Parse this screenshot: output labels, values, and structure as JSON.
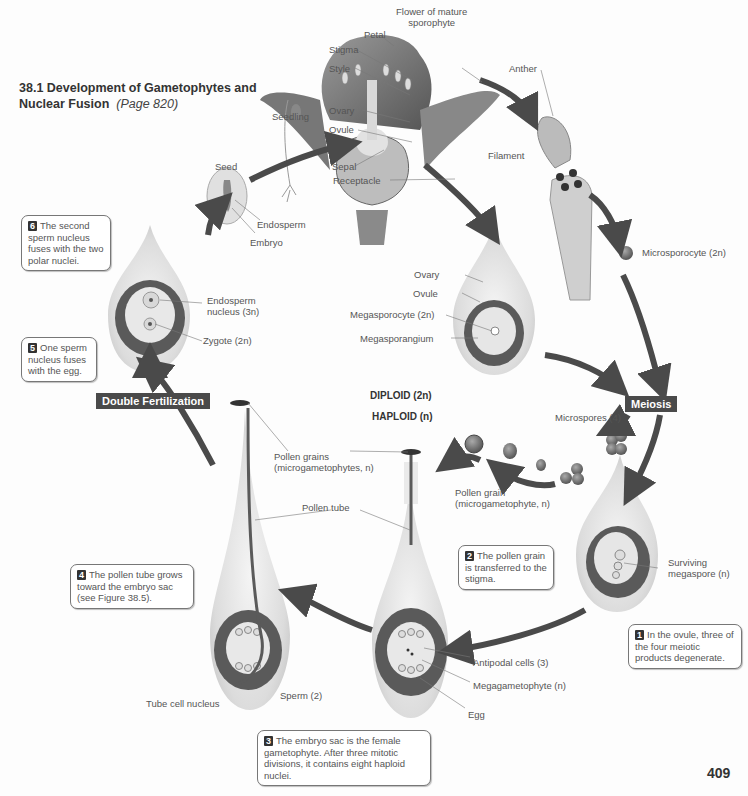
{
  "header": {
    "title": "38.1  Development of Gametophytes and Nuclear Fusion",
    "title_line1": "38.1  Development of Gametophytes and",
    "title_line2": "Nuclear Fusion",
    "page_ref": "(Page 820)"
  },
  "page_number": "409",
  "ploidy_legend": {
    "diploid": "DIPLOID (2n)",
    "haploid": "HAPLOID (n)"
  },
  "process_tags": {
    "meiosis": "Meiosis",
    "double_fertilization": "Double Fertilization"
  },
  "flower": {
    "caption_line1": "Flower of mature",
    "caption_line2": "sporophyte",
    "labels": {
      "petal": "Petal",
      "stigma": "Stigma",
      "style": "Style",
      "ovary": "Ovary",
      "ovule": "Ovule",
      "sepal": "Sepal",
      "receptacle": "Receptacle",
      "anther": "Anther",
      "filament": "Filament"
    }
  },
  "seed": {
    "seedling": "Seedling",
    "seed": "Seed",
    "endosperm": "Endosperm",
    "embryo": "Embryo"
  },
  "microspore_path": {
    "microsporocyte": "Microsporocyte (2n)",
    "microspores": "Microspores (4)",
    "pollen_grain_line1": "Pollen grain",
    "pollen_grain_line2": "(microgametophyte, n)"
  },
  "ovule_stage": {
    "ovary": "Ovary",
    "ovule": "Ovule",
    "megasporocyte": "Megasporocyte (2n)",
    "megasporangium": "Megasporangium",
    "surviving_line1": "Surviving",
    "surviving_line2": "megaspore (n)"
  },
  "gametophyte_stage": {
    "antipodal": "Antipodal cells (3)",
    "megagametophyte": "Megagametophyte (n)",
    "egg": "Egg"
  },
  "pollination_stage": {
    "pollen_grains_line1": "Pollen grains",
    "pollen_grains_line2": "(microgametophytes, n)",
    "pollen_tube": "Pollen tube",
    "tube_cell_nucleus": "Tube cell nucleus",
    "sperm": "Sperm (2)"
  },
  "fertilization_stage": {
    "endosperm_nucleus_line1": "Endosperm",
    "endosperm_nucleus_line2": "nucleus (3n)",
    "zygote": "Zygote (2n)"
  },
  "callouts": [
    {
      "num": "1",
      "text": "In the ovule, three of the four meiotic products degenerate."
    },
    {
      "num": "2",
      "text": "The pollen grain is transferred to the stigma."
    },
    {
      "num": "3",
      "text": "The embryo sac is the female gametophyte. After three mitotic divisions, it contains eight haploid nuclei."
    },
    {
      "num": "4",
      "text": "The pollen tube grows toward the embryo sac (see Figure 38.5)."
    },
    {
      "num": "5",
      "text": "One sperm nucleus fuses with the egg."
    },
    {
      "num": "6",
      "text": "The second sperm nucleus fuses with the two polar nuclei."
    }
  ],
  "colors": {
    "arrow": "#4a4a4a",
    "tag_bg": "#4a4a4a",
    "ovule_dark": "#5a5a5a",
    "tissue_light": "#e6e6e6"
  }
}
